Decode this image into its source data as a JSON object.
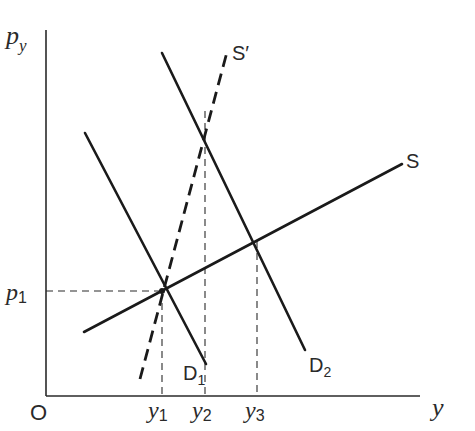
{
  "diagram": {
    "axes": {
      "y_label": "p",
      "y_label_sub": "y",
      "x_label": "y",
      "origin_label": "O"
    },
    "price_ticks": [
      {
        "label": "p",
        "sub": "1"
      }
    ],
    "quantity_ticks": [
      {
        "label": "y",
        "sub": "1"
      },
      {
        "label": "y",
        "sub": "2"
      },
      {
        "label": "y",
        "sub": "3"
      }
    ],
    "curves": {
      "supply": {
        "label": "S",
        "style": "solid"
      },
      "supply_prime": {
        "label": "S′",
        "style": "dashed"
      },
      "demand_1": {
        "label": "D",
        "sub": "1",
        "style": "solid"
      },
      "demand_2": {
        "label": "D",
        "sub": "2",
        "style": "solid"
      }
    },
    "equilibria": [
      {
        "name": "E1",
        "curves": [
          "S",
          "S′",
          "D1"
        ],
        "x": "y1",
        "y": "p1"
      },
      {
        "name": "E2",
        "curves": [
          "S′",
          "D2"
        ],
        "x": "y2"
      },
      {
        "name": "E3",
        "curves": [
          "S",
          "D2"
        ],
        "x": "y3"
      }
    ]
  }
}
